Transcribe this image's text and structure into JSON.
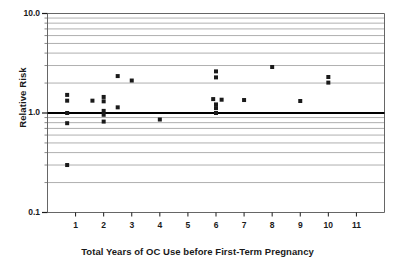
{
  "chart_data": {
    "type": "scatter",
    "title": "",
    "xlabel": "Total Years of OC Use before First-Term Pregnancy",
    "ylabel": "Relative Risk",
    "yscale": "log",
    "xscale": "linear",
    "xlim": [
      0,
      12
    ],
    "ylim": [
      0.1,
      10.0
    ],
    "grid": true,
    "legend": null,
    "xtick_labels": [
      "1",
      "2",
      "3",
      "4",
      "5",
      "6",
      "7",
      "8",
      "9",
      "10",
      "11"
    ],
    "xticks": [
      1,
      2,
      3,
      4,
      5,
      6,
      7,
      8,
      9,
      10,
      11
    ],
    "ytick_labels": [
      "10.0",
      "1.0",
      "0.1"
    ],
    "yticks": [
      10.0,
      1.0,
      0.1
    ],
    "yminor_ticks": [
      9,
      8,
      7,
      6,
      5,
      4,
      3,
      2,
      0.9,
      0.8,
      0.7,
      0.6,
      0.5,
      0.4,
      0.3,
      0.2
    ],
    "gridlines": [
      9,
      8,
      7,
      6,
      5,
      4,
      3,
      2,
      0.9,
      0.8,
      0.7,
      0.6,
      0.5,
      0.4,
      0.3,
      0.2
    ],
    "reference_line": {
      "y": 1.0,
      "label": "null effect",
      "color": "#000000",
      "width": 1.8
    },
    "marker": {
      "shape": "square",
      "size": 4,
      "color": "#1a1a1a"
    },
    "points": [
      {
        "x": 0.7,
        "y": 1.52
      },
      {
        "x": 0.7,
        "y": 1.33
      },
      {
        "x": 0.7,
        "y": 1.0
      },
      {
        "x": 0.7,
        "y": 0.79
      },
      {
        "x": 0.7,
        "y": 0.3
      },
      {
        "x": 1.6,
        "y": 1.33
      },
      {
        "x": 2.0,
        "y": 1.45
      },
      {
        "x": 2.0,
        "y": 1.31
      },
      {
        "x": 2.0,
        "y": 1.05
      },
      {
        "x": 2.0,
        "y": 0.96
      },
      {
        "x": 2.0,
        "y": 0.82
      },
      {
        "x": 2.5,
        "y": 2.35
      },
      {
        "x": 2.5,
        "y": 1.14
      },
      {
        "x": 3.0,
        "y": 2.12
      },
      {
        "x": 4.0,
        "y": 0.86
      },
      {
        "x": 5.9,
        "y": 1.38
      },
      {
        "x": 6.0,
        "y": 2.62
      },
      {
        "x": 6.0,
        "y": 2.28
      },
      {
        "x": 6.0,
        "y": 1.22
      },
      {
        "x": 6.0,
        "y": 1.12
      },
      {
        "x": 6.0,
        "y": 1.0
      },
      {
        "x": 6.2,
        "y": 1.36
      },
      {
        "x": 7.0,
        "y": 1.35
      },
      {
        "x": 8.0,
        "y": 2.9
      },
      {
        "x": 9.0,
        "y": 1.32
      },
      {
        "x": 10.0,
        "y": 2.3
      },
      {
        "x": 10.0,
        "y": 2.02
      }
    ]
  },
  "axes": {
    "plot_frame_color": "#555555",
    "grid_color": "#9a9a9a",
    "text_color": "#1a1a1a"
  }
}
